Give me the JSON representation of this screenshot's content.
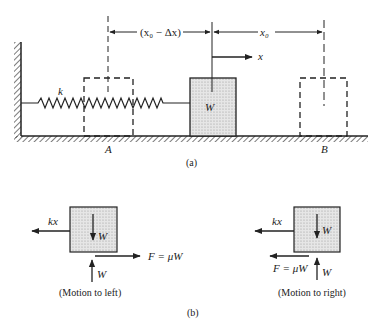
{
  "figure_a": {
    "caption": "(a)",
    "spring_label": "k",
    "block_label": "W",
    "dim_left_label": "(x₀ − Δx)",
    "dim_right_label": "x₀",
    "x_axis_label": "x",
    "point_a": "A",
    "point_b": "B"
  },
  "figure_b": {
    "caption": "(b)",
    "left_fbd": {
      "spring_force": "kx",
      "weight": "W",
      "normal": "W",
      "friction": "F = μW",
      "caption": "(Motion to left)"
    },
    "right_fbd": {
      "spring_force": "kx",
      "weight": "W",
      "normal": "W",
      "friction": "F = μW",
      "caption": "(Motion to right)"
    }
  },
  "colors": {
    "ink": "#222222",
    "block_fill": "#d9d9d9"
  }
}
